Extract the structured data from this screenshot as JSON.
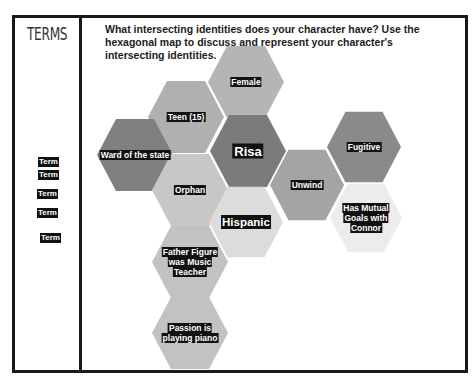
{
  "sidebar": {
    "title": "TERMS",
    "terms": [
      {
        "label": "Term",
        "x": 38,
        "y": 157
      },
      {
        "label": "Term",
        "x": 38,
        "y": 170
      },
      {
        "label": "Term",
        "x": 37,
        "y": 189
      },
      {
        "label": "Term",
        "x": 37,
        "y": 208
      },
      {
        "label": "Term",
        "x": 40,
        "y": 233
      }
    ]
  },
  "prompt": {
    "text": "What intersecting identities does your character have?  Use the hexagonal map to discuss and represent your character's intersecting identities."
  },
  "colors": {
    "dark": "#7a7a7a",
    "medium": "#a3a3a3",
    "light": "#bdbdbd",
    "lighter": "#d1d1d1",
    "lightest": "#e6e6e6",
    "border": "#1a1a1a"
  },
  "hexagons": [
    {
      "id": "female",
      "lines": [
        "Female"
      ],
      "cx": 246,
      "cy": 82,
      "r": 38,
      "fill": "#b5b5b5",
      "size": "normal"
    },
    {
      "id": "teen",
      "lines": [
        "Teen (15)"
      ],
      "cx": 186,
      "cy": 117,
      "r": 38,
      "fill": "#b0b0b0",
      "size": "normal"
    },
    {
      "id": "ward",
      "lines": [
        "Ward of the state"
      ],
      "cx": 135,
      "cy": 155,
      "r": 38,
      "fill": "#808080",
      "size": "normal"
    },
    {
      "id": "risa",
      "lines": [
        "Risa"
      ],
      "cx": 248,
      "cy": 151,
      "r": 38,
      "fill": "#7b7b7b",
      "size": "big"
    },
    {
      "id": "orphan",
      "lines": [
        "Orphan"
      ],
      "cx": 190,
      "cy": 190,
      "r": 38,
      "fill": "#c7c7c7",
      "size": "normal"
    },
    {
      "id": "unwind",
      "lines": [
        "Unwind"
      ],
      "cx": 307,
      "cy": 185,
      "r": 37,
      "fill": "#a4a4a4",
      "size": "normal"
    },
    {
      "id": "fugitive",
      "lines": [
        "Fugitive"
      ],
      "cx": 364,
      "cy": 147,
      "r": 37,
      "fill": "#8a8a8a",
      "size": "normal"
    },
    {
      "id": "hispanic",
      "lines": [
        "Hispanic"
      ],
      "cx": 246,
      "cy": 222,
      "r": 37,
      "fill": "#dcdcdc",
      "size": "mid"
    },
    {
      "id": "mutual",
      "lines": [
        "Has Mutual",
        "Goals with",
        "Connor"
      ],
      "cx": 366,
      "cy": 218,
      "r": 36,
      "fill": "#ececec",
      "size": "normal"
    },
    {
      "id": "father",
      "lines": [
        "Father Figure",
        "was Music",
        "Teacher"
      ],
      "cx": 190,
      "cy": 262,
      "r": 38,
      "fill": "#c2c2c2",
      "size": "normal"
    },
    {
      "id": "passion",
      "lines": [
        "Passion is",
        "playing piano"
      ],
      "cx": 190,
      "cy": 333,
      "r": 38,
      "fill": "#c2c2c2",
      "size": "normal"
    }
  ]
}
